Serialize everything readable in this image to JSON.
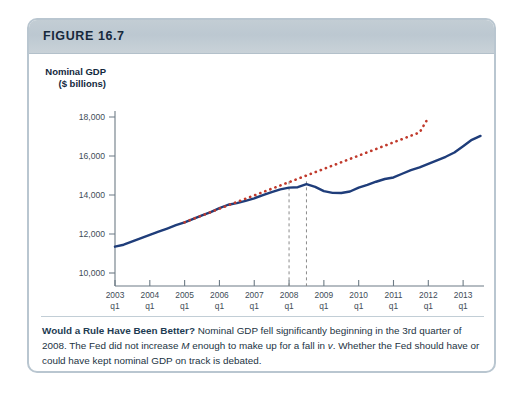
{
  "figure": {
    "label": "FIGURE 16.7",
    "border_color": "#b9c6d0",
    "header_color": "#c3cdd4"
  },
  "caption": {
    "lead": "Would a Rule Have Been Better?",
    "body_part1": " Nominal GDP fell significantly beginning in the  3rd quarter of 2008. The Fed  did not increase ",
    "italic1": "M",
    "body_part2": " enough to make up for a fall in ",
    "italic2": "v",
    "body_part3": ". Whether the Fed should have or could have kept nominal GDP on track is debated."
  },
  "chart_data": {
    "type": "line",
    "title": "",
    "xlabel": "Year and quarter",
    "ylabel": "Nominal GDP ($ billions)",
    "ylabel_line1": "Nominal GDP",
    "ylabel_line2": "($ billions)",
    "ylim": [
      9000,
      18800
    ],
    "yticks": [
      10000,
      12000,
      14000,
      16000,
      18000
    ],
    "ytick_labels": [
      "10,000",
      "12,000",
      "14,000",
      "16,000",
      "18,000"
    ],
    "xlim": [
      2003.0,
      2013.6
    ],
    "xticks": [
      2003,
      2004,
      2005,
      2006,
      2007,
      2008,
      2009,
      2010,
      2011,
      2012,
      2013
    ],
    "xtick_labels_year": [
      "2003",
      "2004",
      "2005",
      "2006",
      "2007",
      "2008",
      "2009",
      "2010",
      "2011",
      "2012",
      "2013"
    ],
    "xtick_labels_quarter": [
      "q1",
      "q1",
      "q1",
      "q1",
      "q1",
      "q1",
      "q1",
      "q1",
      "q1",
      "q1",
      "q1"
    ],
    "grid": false,
    "legend": "none",
    "annotations": [
      {
        "name": "marker-2008-q1",
        "x": 2008.0,
        "label_year": "",
        "label_quarter": "",
        "style": "dashed-vertical",
        "color": "#8a8a8a"
      },
      {
        "name": "marker-2008-q3",
        "x": 2008.5,
        "label_year": "2008",
        "label_quarter": "q3",
        "style": "dashed-vertical",
        "color": "#8a8a8a"
      }
    ],
    "series": [
      {
        "name": "Actual nominal GDP",
        "color": "#1f3d7a",
        "style": "solid",
        "x": [
          2003.0,
          2003.25,
          2003.5,
          2003.75,
          2004.0,
          2004.25,
          2004.5,
          2004.75,
          2005.0,
          2005.25,
          2005.5,
          2005.75,
          2006.0,
          2006.25,
          2006.5,
          2006.75,
          2007.0,
          2007.25,
          2007.5,
          2007.75,
          2008.0,
          2008.25,
          2008.5,
          2008.75,
          2009.0,
          2009.25,
          2009.5,
          2009.75,
          2010.0,
          2010.25,
          2010.5,
          2010.75,
          2011.0,
          2011.25,
          2011.5,
          2011.75,
          2012.0,
          2012.25,
          2012.5,
          2012.75,
          2013.0,
          2013.25,
          2013.5
        ],
        "values": [
          11350,
          11450,
          11620,
          11790,
          11950,
          12120,
          12280,
          12450,
          12600,
          12780,
          12950,
          13120,
          13330,
          13500,
          13580,
          13700,
          13830,
          13990,
          14150,
          14290,
          14380,
          14400,
          14560,
          14420,
          14200,
          14110,
          14100,
          14180,
          14380,
          14520,
          14680,
          14820,
          14900,
          15090,
          15280,
          15420,
          15600,
          15780,
          15960,
          16180,
          16500,
          16830,
          17030
        ]
      },
      {
        "name": "Nominal GDP trend rule",
        "color": "#c0392b",
        "style": "dotted",
        "x": [
          2005.0,
          2005.25,
          2005.5,
          2005.75,
          2006.0,
          2006.25,
          2006.5,
          2006.75,
          2007.0,
          2007.25,
          2007.5,
          2007.75,
          2008.0,
          2008.25,
          2008.5,
          2008.75,
          2009.0,
          2009.25,
          2009.5,
          2009.75,
          2010.0,
          2010.25,
          2010.5,
          2010.75,
          2011.0,
          2011.25,
          2011.5,
          2011.75,
          2012.0
        ],
        "values": [
          12600,
          12780,
          12950,
          13120,
          13300,
          13470,
          13640,
          13810,
          13980,
          14150,
          14320,
          14490,
          14660,
          14830,
          15000,
          15170,
          15340,
          15510,
          15680,
          15850,
          16020,
          16190,
          16360,
          16530,
          16700,
          16870,
          17040,
          17210,
          17960
        ]
      }
    ]
  }
}
